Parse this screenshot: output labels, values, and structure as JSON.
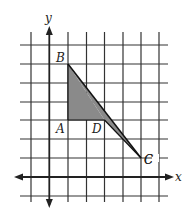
{
  "diagram": {
    "type": "coordinate-plane-triangle",
    "axes": {
      "x_label": "x",
      "y_label": "y"
    },
    "grid": {
      "x_range": [
        -1,
        6
      ],
      "y_range": [
        -1,
        7
      ],
      "origin_px": [
        49.3,
        177
      ],
      "unit_px": 18.5
    },
    "points": [
      {
        "name": "A",
        "coord": [
          1,
          3
        ]
      },
      {
        "name": "B",
        "coord": [
          1,
          6
        ]
      },
      {
        "name": "C",
        "coord": [
          5,
          1
        ]
      },
      {
        "name": "D",
        "coord": [
          3,
          3
        ]
      }
    ],
    "shaded_regions": [
      {
        "vertices": [
          "A",
          "B",
          "D"
        ],
        "fill": "#8a8a8a"
      },
      {
        "vertices": [
          "B",
          "D",
          "C"
        ],
        "fill": "#8a8a8a"
      }
    ],
    "segments": [
      [
        "B",
        "C"
      ],
      [
        "A",
        "B"
      ],
      [
        "A",
        "D"
      ],
      [
        "D",
        "C"
      ]
    ],
    "colors": {
      "grid": "#333333",
      "axis": "#222222",
      "shade": "#8a8a8a",
      "line": "#111111"
    }
  }
}
